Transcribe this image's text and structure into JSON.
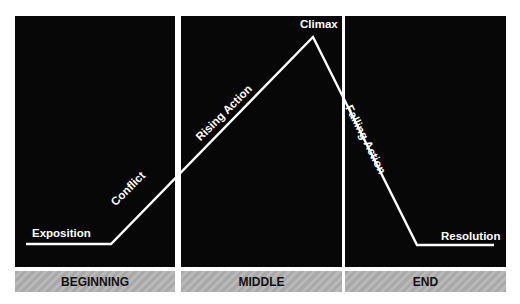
{
  "diagram": {
    "colors": {
      "panel": "#070707",
      "line": "#ffffff",
      "bar": "#a9a9a9",
      "bar_text": "#111111"
    },
    "sections": [
      {
        "label": "BEGINNING"
      },
      {
        "label": "MIDDLE"
      },
      {
        "label": "END"
      }
    ],
    "stages": {
      "exposition": "Exposition",
      "conflict": "Conflict",
      "rising_action": "Rising Action",
      "climax": "Climax",
      "falling_action": "Falling Action",
      "resolution": "Resolution"
    },
    "plot_line_points": [
      [
        26,
        244
      ],
      [
        111,
        244
      ],
      [
        313,
        37
      ],
      [
        417,
        245
      ],
      [
        494,
        245
      ]
    ]
  }
}
